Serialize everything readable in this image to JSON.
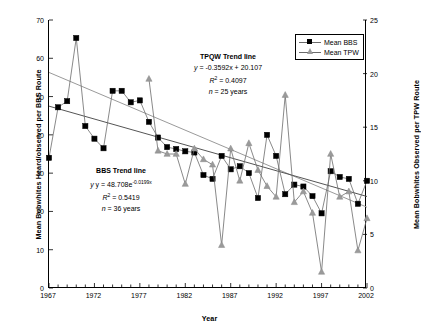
{
  "chart_data": {
    "type": "line",
    "title": "",
    "xlabel": "Year",
    "ylabel": "Mean Bobwhites Heard/observed per BBS Route",
    "ylabel_right": "Mean Bobwhites Observed per TPW Route",
    "xlim": [
      1967,
      2002
    ],
    "ylim": [
      0,
      70
    ],
    "ylim_right": [
      0,
      25
    ],
    "grid": false,
    "legend_position": "top-right",
    "x_tick_labels": [
      "1967",
      "1972",
      "1977",
      "1982",
      "1987",
      "1992",
      "1997",
      "2002"
    ],
    "x_tick_values": [
      1967,
      1972,
      1977,
      1982,
      1987,
      1992,
      1997,
      2002
    ],
    "y_tick_labels_left": [
      "0",
      "10",
      "20",
      "30",
      "40",
      "50",
      "60",
      "70"
    ],
    "y_tick_values_left": [
      0,
      10,
      20,
      30,
      40,
      50,
      60,
      70
    ],
    "y_tick_labels_right": [
      "0",
      "5",
      "10",
      "15",
      "20",
      "25"
    ],
    "y_tick_values_right": [
      0,
      5,
      10,
      15,
      20,
      25
    ],
    "x_minor_tick_step": 1,
    "series": [
      {
        "name": "Mean BBS",
        "axis": "left",
        "marker": "square",
        "color": "#000000",
        "x": [
          1967,
          1968,
          1969,
          1970,
          1971,
          1972,
          1973,
          1974,
          1975,
          1976,
          1977,
          1978,
          1979,
          1980,
          1981,
          1982,
          1983,
          1984,
          1985,
          1986,
          1987,
          1988,
          1989,
          1990,
          1991,
          1992,
          1993,
          1994,
          1995,
          1996,
          1997,
          1998,
          1999,
          2000,
          2001,
          2002
        ],
        "values": [
          34.0,
          47.2,
          48.8,
          65.3,
          42.3,
          39.0,
          36.5,
          51.5,
          51.5,
          48.5,
          49.0,
          43.4,
          39.3,
          36.8,
          36.3,
          35.7,
          35.4,
          29.5,
          28.5,
          34.5,
          31.0,
          31.8,
          30.0,
          23.5,
          40.0,
          34.5,
          24.5,
          27.0,
          26.5,
          24.0,
          19.5,
          30.5,
          29.0,
          28.5,
          22.0,
          28.0
        ]
      },
      {
        "name": "Mean TPW",
        "axis": "right",
        "marker": "triangle",
        "color": "#9a9a9a",
        "x": [
          1978,
          1979,
          1980,
          1981,
          1982,
          1983,
          1984,
          1985,
          1986,
          1987,
          1988,
          1989,
          1990,
          1991,
          1992,
          1993,
          1994,
          1995,
          1996,
          1997,
          1998,
          1999,
          2000,
          2001,
          2002
        ],
        "values": [
          19.5,
          12.8,
          12.5,
          12.5,
          9.7,
          13.0,
          12.0,
          11.5,
          4.0,
          13.0,
          10.0,
          13.5,
          11.0,
          9.5,
          8.5,
          18.0,
          8.0,
          9.0,
          7.0,
          1.5,
          12.5,
          8.5,
          9.0,
          3.5,
          6.5
        ]
      }
    ],
    "trendlines": [
      {
        "name": "TPQW Trend line",
        "equation": "y = -0.3592x + 20.107",
        "r_squared_label": "R",
        "r_squared_exp": "2",
        "r_squared_value": "= 0.4097",
        "n_label": "n",
        "n_value": "= 25 years",
        "axis": "right",
        "color": "#9a9a9a",
        "start": {
          "year": 1967,
          "value": 20.107
        },
        "end": {
          "year": 2002,
          "value": 7.535
        }
      },
      {
        "name": "BBS Trend line",
        "equation_prefix": "y = 48.708e",
        "equation_exp": "-0.0199x",
        "r_squared_label": "R",
        "r_squared_exp": "2",
        "r_squared_value": "= 0.5419",
        "n_label": "n",
        "n_value": "= 36 years",
        "axis": "left",
        "color": "#555555",
        "start": {
          "year": 1967,
          "value": 47.5
        },
        "end": {
          "year": 2002,
          "value": 23.9
        }
      }
    ]
  },
  "legend": {
    "items": [
      {
        "label": "Mean BBS",
        "marker": "square",
        "color": "#000000"
      },
      {
        "label": "Mean TPW",
        "marker": "triangle",
        "color": "#9a9a9a"
      }
    ]
  }
}
